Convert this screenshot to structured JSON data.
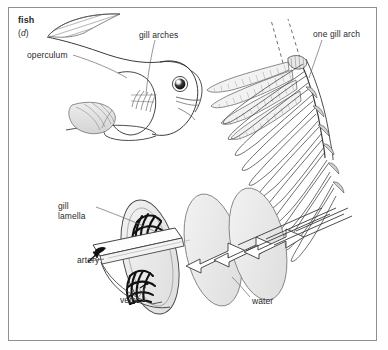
{
  "figure": {
    "title_label": "fish",
    "panel_letter": "(d)",
    "panel_letter_plain": "d",
    "labels": {
      "operculum": "operculum",
      "gill_arches": "gill arches",
      "one_gill_arch": "one gill arch",
      "gill_lamella_line1": "gill",
      "gill_lamella_line2": "lamella",
      "artery": "artery",
      "vein": "vein",
      "water": "water"
    },
    "colors": {
      "frame_border": "#8d8f92",
      "background": "#ffffff",
      "ink": "#2a2a2a",
      "line": "#3a3a3a",
      "light_line": "#8a8a8a",
      "fill_light": "#f0f0f0",
      "fill_shade": "#e2e2e2",
      "vessel": "#111111"
    },
    "icon_names": [
      "fish-body-outline",
      "dorsal-fin-hatching",
      "fish-eye",
      "operculum-leader-line",
      "gill-arch-leader-line",
      "gill-arch-detail",
      "dashed-extension-lines",
      "gill-lamella-oval",
      "blood-vessel-network",
      "artery-arrow",
      "water-flow-arrow"
    ]
  }
}
